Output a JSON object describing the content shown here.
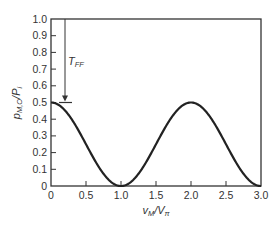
{
  "chart_data": {
    "type": "line",
    "title": "",
    "xlabel": "v_M/V_π",
    "ylabel": "p_M,O/P_i",
    "xlim": [
      0,
      3.0
    ],
    "ylim": [
      0,
      1.0
    ],
    "x_ticks": [
      "0",
      "0.5",
      "1.0",
      "1.5",
      "2.0",
      "2.5",
      "3.0"
    ],
    "y_ticks": [
      "0",
      "0.1",
      "0.2",
      "0.3",
      "0.4",
      "0.5",
      "0.6",
      "0.7",
      "0.8",
      "0.9",
      "1.0"
    ],
    "grid": false,
    "legend": null,
    "series": [
      {
        "name": "p_M,O/P_i",
        "formula": "0.5*cos^2(pi*x/2)",
        "x": [
          0,
          0.25,
          0.5,
          0.75,
          1.0,
          1.25,
          1.5,
          1.75,
          2.0,
          2.25,
          2.5,
          2.75,
          3.0
        ],
        "values": [
          0.5,
          0.427,
          0.25,
          0.073,
          0.0,
          0.073,
          0.25,
          0.427,
          0.5,
          0.427,
          0.25,
          0.073,
          0.0
        ]
      }
    ],
    "annotations": [
      {
        "text": "T_FF",
        "type": "arrow",
        "x": 0.2,
        "from_y": 1.0,
        "to_y": 0.5,
        "description": "vertical arrow from 1.0 down to 0.5 marker bar, labeled T_FF"
      }
    ]
  },
  "labels": {
    "xlabel_main": "v",
    "xlabel_sub": "M",
    "xlabel_sep": "/V",
    "xlabel_sub2": "π",
    "ylabel_main": "p",
    "ylabel_sub": "M,O",
    "ylabel_sep": "/P",
    "ylabel_sub2": "i",
    "annotation_main": "T",
    "annotation_sub": "FF"
  }
}
